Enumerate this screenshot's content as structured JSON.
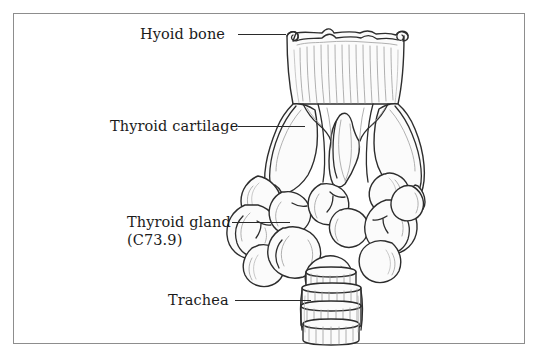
{
  "figure": {
    "background_color": "#ffffff",
    "frame_color": "#8d8d8d",
    "ink_color": "#2a2a2a",
    "shading_color": "#9a9a9a",
    "text_color": "#1b1b1b"
  },
  "labels": [
    {
      "id": "hyoid-bone",
      "text": "Hyoid bone",
      "second_line": "",
      "leader": true
    },
    {
      "id": "thyroid-cartilage",
      "text": "Thyroid cartilage",
      "second_line": "",
      "leader": true
    },
    {
      "id": "thyroid-gland",
      "text": "Thyroid gland",
      "second_line": "(C73.9)",
      "leader": true
    },
    {
      "id": "trachea",
      "text": "Trachea",
      "second_line": "",
      "leader": true
    }
  ],
  "illustration": {
    "structures": [
      "hyoid-bone",
      "thyroid-cartilage",
      "thyroid-gland",
      "trachea"
    ],
    "style": "line-art pen and ink anatomical drawing, anterior view"
  }
}
